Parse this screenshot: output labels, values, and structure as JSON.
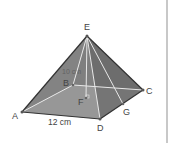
{
  "diagram": {
    "type": "square-pyramid",
    "colors": {
      "background": "#ffffff",
      "front_face": "#8a8a8a",
      "right_face": "#6c6c6c",
      "back_left_face": "#7a7a7a",
      "base": "#a6a6a6",
      "edge_dark": "#333333",
      "hidden_line": "#e8e8e8",
      "label": "#444444",
      "frame": "#c8c8c8"
    },
    "points": {
      "E": {
        "label": "E",
        "x": 87,
        "y": 36
      },
      "A": {
        "label": "A",
        "x": 22,
        "y": 112
      },
      "B": {
        "label": "B",
        "x": 73,
        "y": 85
      },
      "C": {
        "label": "C",
        "x": 143,
        "y": 90
      },
      "D": {
        "label": "D",
        "x": 100,
        "y": 119
      },
      "F": {
        "label": "F",
        "x": 86,
        "y": 98
      },
      "G": {
        "label": "G",
        "x": 123,
        "y": 104
      }
    },
    "dimension_label": "12 cm",
    "ghost_label": "10 cm"
  }
}
